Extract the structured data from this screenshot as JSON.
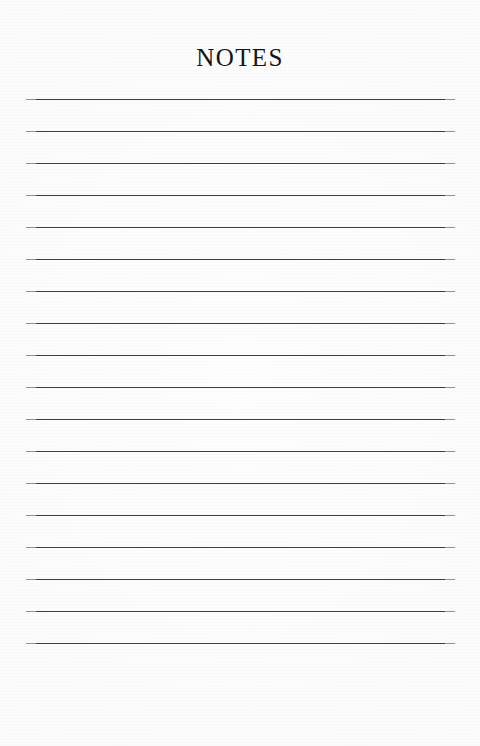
{
  "page": {
    "title": "NOTES",
    "background_color": "#fcfcfc",
    "width": 480,
    "height": 746
  },
  "ruled_lines": {
    "count": 18,
    "color": "#3f3f3f",
    "thickness_px": 1.5,
    "left_x": 26,
    "right_x": 455,
    "first_line_y": 99,
    "line_spacing_px": 32,
    "labels": [
      "note-line-1",
      "note-line-2",
      "note-line-3",
      "note-line-4",
      "note-line-5",
      "note-line-6",
      "note-line-7",
      "note-line-8",
      "note-line-9",
      "note-line-10",
      "note-line-11",
      "note-line-12",
      "note-line-13",
      "note-line-14",
      "note-line-15",
      "note-line-16",
      "note-line-17",
      "note-line-18"
    ]
  }
}
